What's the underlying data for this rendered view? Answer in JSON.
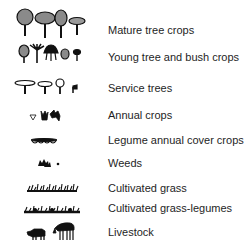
{
  "legend": {
    "items": [
      {
        "label": "Mature tree crops",
        "icon": "mature-tree-crops-icon"
      },
      {
        "label": "Young tree and bush crops",
        "icon": "young-tree-bush-crops-icon"
      },
      {
        "label": "Service trees",
        "icon": "service-trees-icon"
      },
      {
        "label": "Annual crops",
        "icon": "annual-crops-icon"
      },
      {
        "label": "Legume  annual cover crops",
        "icon": "legume-cover-crops-icon"
      },
      {
        "label": "Weeds",
        "icon": "weeds-icon"
      },
      {
        "label": "Cultivated grass",
        "icon": "cultivated-grass-icon"
      },
      {
        "label": "Cultivated grass-legumes",
        "icon": "cultivated-grass-legumes-icon"
      },
      {
        "label": "Livestock",
        "icon": "livestock-icon"
      }
    ]
  },
  "colors": {
    "canopy_fill": "#8a8a8a",
    "ink": "#111111",
    "text": "#1e1e1e"
  }
}
